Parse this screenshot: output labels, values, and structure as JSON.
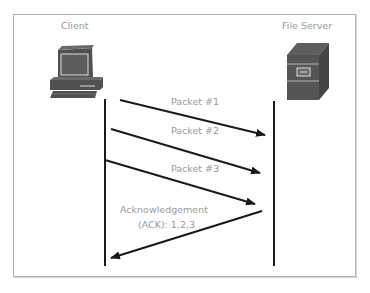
{
  "diagram": {
    "type": "sequence",
    "participants": [
      {
        "id": "client",
        "label": "Client",
        "icon": "desktop-computer-icon"
      },
      {
        "id": "server",
        "label": "File Server",
        "icon": "server-tower-icon"
      }
    ],
    "messages": [
      {
        "from": "client",
        "to": "server",
        "label": "Packet #1"
      },
      {
        "from": "client",
        "to": "server",
        "label": "Packet #2"
      },
      {
        "from": "client",
        "to": "server",
        "label": "Packet #3"
      },
      {
        "from": "server",
        "to": "client",
        "label_line1": "Acknowledgement",
        "label_line2": "(ACK): 1,2,3"
      }
    ],
    "colors": {
      "line": "#1a1a1a",
      "label": "#9a9a9a",
      "icon": "#505050",
      "border": "#b0b0b0"
    }
  }
}
